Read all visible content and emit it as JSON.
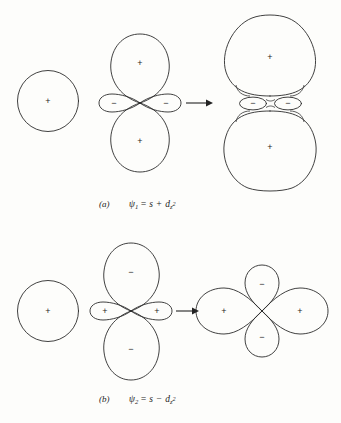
{
  "figure": {
    "background_color": "#fdfdfb",
    "line_color": "#2b2b2b",
    "width": 341,
    "height": 423
  },
  "panels": [
    {
      "id": "a",
      "label": "(a)",
      "caption": {
        "psi": "ψ",
        "psi_subscript": "1",
        "equals": "=",
        "term_s": "s",
        "operator": "+",
        "term_d": "d",
        "d_subscript": "z",
        "d_superscript": "2",
        "full_text": "(a)   ψ1 = s + dz2"
      },
      "operand_s": {
        "name": "s-orbital",
        "sign": "+",
        "shape": "circle"
      },
      "operand_d": {
        "name": "d-z2-orbital",
        "top_lobe_sign": "+",
        "bottom_lobe_sign": "+",
        "left_torus_sign": "−",
        "right_torus_sign": "−"
      },
      "arrow": {
        "name": "transform-arrow",
        "direction": "right"
      },
      "result": {
        "name": "hybrid-orbital-psi1",
        "top_lobe_sign": "+",
        "bottom_lobe_sign": "+",
        "left_torus_sign": "−",
        "right_torus_sign": "−"
      }
    },
    {
      "id": "b",
      "label": "(b)",
      "caption": {
        "psi": "ψ",
        "psi_subscript": "2",
        "equals": "=",
        "term_s": "s",
        "operator": "−",
        "term_d": "d",
        "d_subscript": "z",
        "d_superscript": "2",
        "full_text": "(b)   ψ2 = s − dz2"
      },
      "operand_s": {
        "name": "s-orbital",
        "sign": "+",
        "shape": "circle"
      },
      "operand_d": {
        "name": "negative-d-z2-orbital",
        "top_lobe_sign": "−",
        "bottom_lobe_sign": "−",
        "left_torus_sign": "+",
        "right_torus_sign": "+"
      },
      "arrow": {
        "name": "transform-arrow",
        "direction": "right"
      },
      "result": {
        "name": "hybrid-orbital-psi2",
        "left_lobe_sign": "+",
        "right_lobe_sign": "+",
        "top_lobe_sign": "−",
        "bottom_lobe_sign": "−"
      }
    }
  ]
}
